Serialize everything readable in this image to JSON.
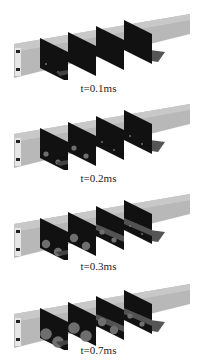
{
  "figure": {
    "panels": [
      {
        "label": "t=0.1ms",
        "stage": 0
      },
      {
        "label": "t=0.2ms",
        "stage": 1
      },
      {
        "label": "t=0.3ms",
        "stage": 2
      },
      {
        "label": "t=0.7ms",
        "stage": 3
      }
    ],
    "colors": {
      "channel_top": "#b8b8b8",
      "channel_side": "#9a9a9a",
      "slice": "#111111",
      "blob": "#6e6e6e",
      "inlet_dark": "#222222",
      "inlet_light": "#e6e6e6"
    }
  }
}
